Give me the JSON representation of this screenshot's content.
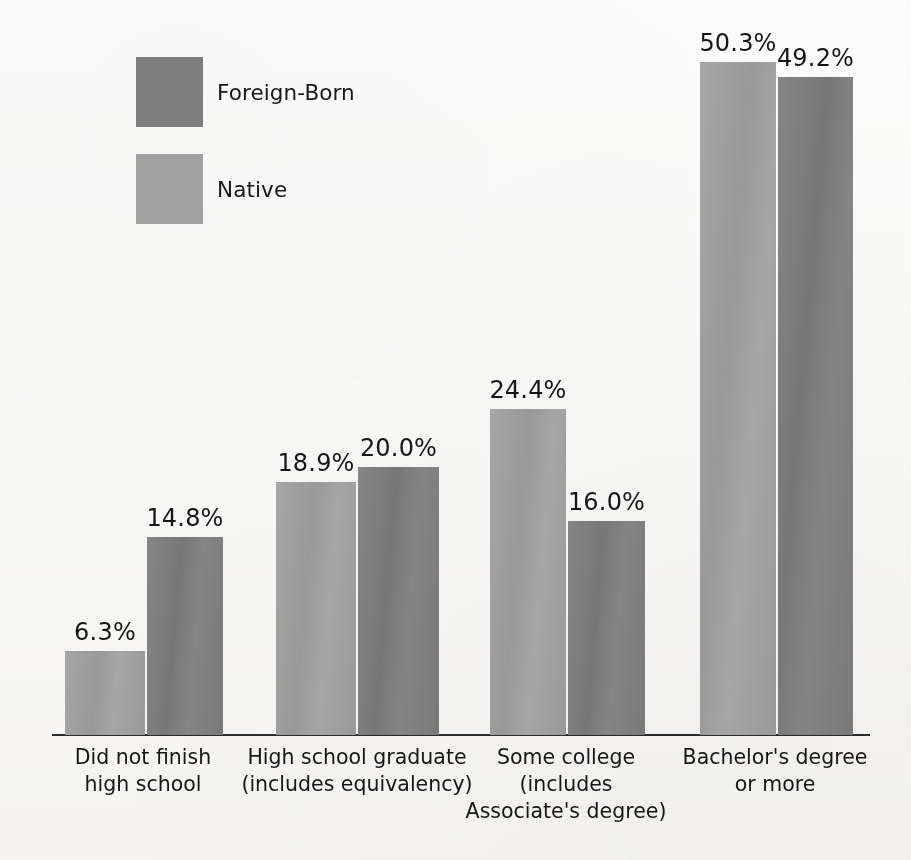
{
  "chart_data": {
    "type": "bar",
    "title": "",
    "subtitle": "",
    "xlabel": "",
    "ylabel": "",
    "ylim": [
      0,
      55
    ],
    "grid": false,
    "legend_position": "upper-left",
    "value_suffix": "%",
    "categories": [
      "Did not finish high school",
      "High school graduate (includes equivalency)",
      "Some college (includes Associate's degree)",
      "Bachelor's degree or more"
    ],
    "category_lines": [
      [
        "Did not finish",
        "high school"
      ],
      [
        "High school graduate",
        "(includes equivalency)"
      ],
      [
        "Some college",
        "(includes",
        "Associate's degree)"
      ],
      [
        "Bachelor's degree",
        "or more"
      ]
    ],
    "series": [
      {
        "name": "Native",
        "color": "#a3a3a3",
        "values": [
          6.3,
          18.9,
          24.4,
          50.3
        ],
        "labels": [
          "6.3%",
          "18.9%",
          "24.4%",
          "50.3%"
        ]
      },
      {
        "name": "Foreign-Born",
        "color": "#7f7f7f",
        "values": [
          14.8,
          20.0,
          16.0,
          49.2
        ],
        "labels": [
          "14.8%",
          "20.0%",
          "16.0%",
          "49.2%"
        ]
      }
    ]
  },
  "legend": {
    "items": [
      {
        "label": "Foreign-Born",
        "color": "#7f7f7f"
      },
      {
        "label": "Native",
        "color": "#a3a3a3"
      }
    ]
  },
  "axis": {
    "baseline_color": "#2b2b2b"
  }
}
